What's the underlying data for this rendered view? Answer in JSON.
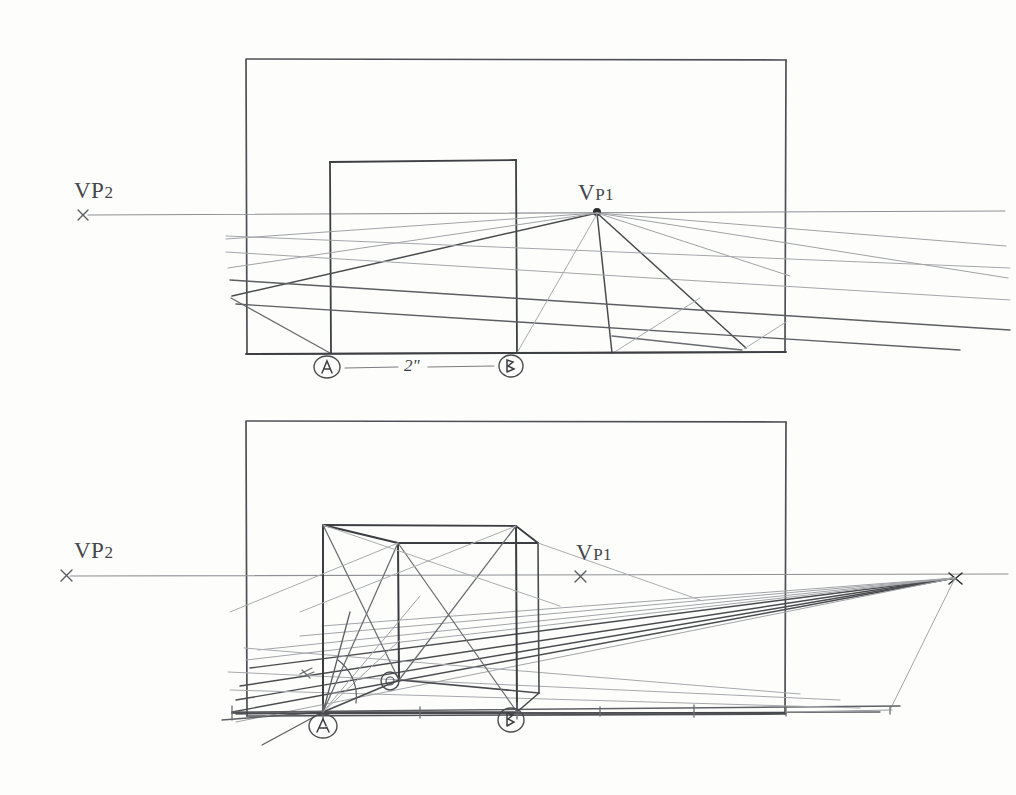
{
  "document": {
    "kind": "hand-drawn pencil sketch",
    "title": "Two-point perspective cube construction",
    "background_color": "#fdfdfc",
    "ink_color": "#4a4c50",
    "light_ink_color": "#9b9da1",
    "dark_ink_color": "#2f3135"
  },
  "panels": [
    {
      "id": "top-panel",
      "name": "top-construction-panel",
      "frame": {
        "x": 246,
        "y": 58,
        "width": 540,
        "height": 296
      },
      "horizon_y": 213,
      "ground_y": 353,
      "labels": {
        "vp2": {
          "main": "VP",
          "sub": "2",
          "x": 74,
          "y": 178,
          "marker_x": 83,
          "marker_y": 215
        },
        "vp1": {
          "main": "V",
          "sub": "P1",
          "x": 578,
          "y": 180,
          "marker_x": 597,
          "marker_y": 212
        }
      },
      "measure_points": [
        {
          "label": "A",
          "x": 327,
          "y": 367
        },
        {
          "label": "B",
          "x": 511,
          "y": 366
        }
      ],
      "dimension": {
        "text": "2\"",
        "x": 411,
        "y": 355,
        "from_x": 345,
        "to_x": 494,
        "y_line": 367
      },
      "square": {
        "x": 330,
        "y": 161,
        "width": 186,
        "height": 192
      }
    },
    {
      "id": "bottom-panel",
      "name": "bottom-construction-panel",
      "frame": {
        "x": 246,
        "y": 420,
        "width": 540,
        "height": 296
      },
      "horizon_y": 573,
      "ground_y": 714,
      "labels": {
        "vp2": {
          "main": "VP",
          "sub": "2",
          "x": 74,
          "y": 538,
          "marker_x": 66,
          "marker_y": 575
        },
        "vp1": {
          "main": "V",
          "sub": "P1",
          "x": 576,
          "y": 540,
          "marker_x": 580,
          "marker_y": 577
        }
      },
      "vanishing_point_right": {
        "x": 955,
        "y": 578
      },
      "measure_points": [
        {
          "label": "A",
          "x": 323,
          "y": 725
        },
        {
          "label": "B",
          "x": 511,
          "y": 719
        },
        {
          "label": "C",
          "x": 390,
          "y": 681
        }
      ],
      "cube": {
        "front_left_x": 323,
        "front_right_x": 516,
        "top_y": 524,
        "bottom_y": 711
      }
    }
  ],
  "annotations": {
    "vp_label_text": "VP",
    "inch_mark": "\"",
    "measure_marks": [
      "A",
      "B",
      "C"
    ]
  }
}
